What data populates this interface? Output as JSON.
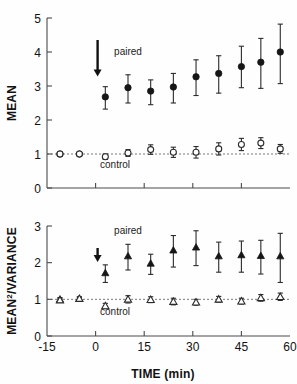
{
  "figure": {
    "x_axis": {
      "title": "TIME (min)",
      "ticks": [
        -15,
        0,
        15,
        30,
        45,
        60
      ],
      "tick_labels": [
        "-15",
        "0",
        "15",
        "30",
        "45",
        "60"
      ],
      "min": -15,
      "max": 60
    },
    "annotations": {
      "paired_label": "paired",
      "control_label": "control",
      "arrow_time": 0,
      "arrow_name": "stimulus-arrow"
    },
    "colors": {
      "paired": "#161616",
      "control": "#ffffff",
      "axis": "#4a4a4a",
      "reference_line": "#555555"
    }
  },
  "chart_data": [
    {
      "type": "scatter",
      "panel": "top",
      "title": "",
      "xlabel": "",
      "ylabel": "MEAN",
      "ylim": [
        0,
        5
      ],
      "xlim": [
        -15,
        60
      ],
      "yticks": [
        0,
        1,
        2,
        3,
        4,
        5
      ],
      "ytick_labels": [
        "0",
        "1",
        "2",
        "3",
        "4",
        "5"
      ],
      "grid": false,
      "reference_line_y": 1,
      "legend": [
        "paired",
        "control"
      ],
      "legend_position": "inline-annotation",
      "series": [
        {
          "name": "paired",
          "marker": "filled-circle",
          "x": [
            -11,
            -5,
            3,
            10,
            17,
            24,
            31,
            38,
            45,
            51,
            57
          ],
          "values": [
            1.0,
            1.0,
            2.68,
            2.95,
            2.85,
            2.97,
            3.27,
            3.37,
            3.57,
            3.7,
            4.0
          ],
          "err_low": [
            0.05,
            0.05,
            0.36,
            0.45,
            0.4,
            0.47,
            0.55,
            0.58,
            0.62,
            0.77,
            0.93
          ],
          "err_high": [
            0.05,
            0.05,
            0.3,
            0.38,
            0.33,
            0.4,
            0.5,
            0.52,
            0.6,
            0.7,
            0.82
          ]
        },
        {
          "name": "control",
          "marker": "open-circle",
          "x": [
            -11,
            -5,
            3,
            10,
            17,
            24,
            31,
            38,
            45,
            51,
            57
          ],
          "values": [
            1.0,
            1.0,
            0.92,
            1.03,
            1.13,
            1.05,
            1.05,
            1.15,
            1.28,
            1.32,
            1.15
          ],
          "err_low": [
            0.03,
            0.03,
            0.08,
            0.1,
            0.14,
            0.15,
            0.17,
            0.18,
            0.18,
            0.16,
            0.13
          ],
          "err_high": [
            0.03,
            0.03,
            0.08,
            0.1,
            0.14,
            0.15,
            0.17,
            0.18,
            0.18,
            0.16,
            0.13
          ]
        }
      ]
    },
    {
      "type": "scatter",
      "panel": "bottom",
      "title": "",
      "xlabel": "TIME (min)",
      "ylabel": "MEAN²/VARIANCE",
      "ylim": [
        0,
        3
      ],
      "xlim": [
        -15,
        60
      ],
      "yticks": [
        0,
        1,
        2,
        3
      ],
      "ytick_labels": [
        "0",
        "1",
        "2",
        "3"
      ],
      "grid": false,
      "reference_line_y": 1,
      "legend": [
        "paired",
        "control"
      ],
      "legend_position": "inline-annotation",
      "series": [
        {
          "name": "paired",
          "marker": "filled-triangle",
          "x": [
            -11,
            -5,
            3,
            10,
            17,
            24,
            31,
            38,
            45,
            51,
            57
          ],
          "values": [
            1.0,
            1.02,
            1.72,
            2.18,
            1.98,
            2.34,
            2.42,
            2.18,
            2.21,
            2.19,
            2.18
          ],
          "err_low": [
            0.05,
            0.05,
            0.26,
            0.38,
            0.3,
            0.46,
            0.5,
            0.44,
            0.47,
            0.5,
            0.72
          ],
          "err_high": [
            0.05,
            0.05,
            0.22,
            0.32,
            0.25,
            0.4,
            0.45,
            0.38,
            0.38,
            0.42,
            0.62
          ]
        },
        {
          "name": "control",
          "marker": "open-triangle",
          "x": [
            -11,
            -5,
            3,
            10,
            17,
            24,
            31,
            38,
            45,
            51,
            57
          ],
          "values": [
            0.98,
            1.02,
            0.82,
            1.0,
            0.99,
            0.94,
            0.92,
            1.0,
            0.95,
            1.04,
            1.07
          ],
          "err_low": [
            0.04,
            0.04,
            0.07,
            0.1,
            0.08,
            0.09,
            0.08,
            0.08,
            0.08,
            0.09,
            0.1
          ],
          "err_high": [
            0.04,
            0.04,
            0.07,
            0.1,
            0.08,
            0.09,
            0.08,
            0.08,
            0.08,
            0.09,
            0.1
          ]
        }
      ]
    }
  ]
}
